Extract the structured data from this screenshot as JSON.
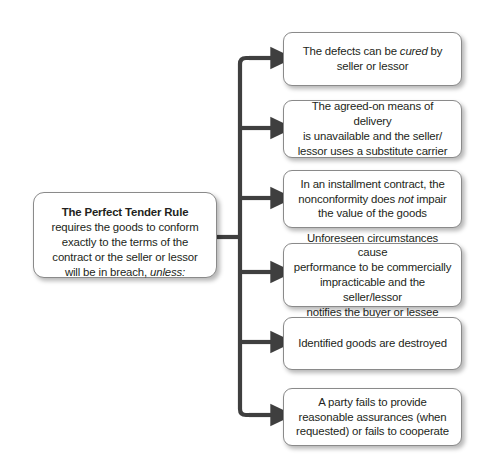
{
  "diagram": {
    "type": "flowchart-bracket",
    "root": {
      "heading": "The Perfect Tender Rule",
      "body_line1": "requires the goods to conform",
      "body_line2": "exactly to the terms of the",
      "body_line3": "contract or the seller or lessor",
      "body_line4_pre": "will be in breach, ",
      "body_line4_ital": "unless:",
      "full_text": "The Perfect Tender Rule requires the goods to conform exactly to the terms of the contract or the seller or lessor will be in breach, unless:"
    },
    "branches": [
      {
        "id": "defects-cured",
        "segments": [
          {
            "text": "The defects can be ",
            "style": "normal"
          },
          {
            "text": "cured",
            "style": "italic"
          },
          {
            "text": " by\nseller or lessor",
            "style": "normal"
          }
        ],
        "full_text": "The defects can be cured by seller or lessor"
      },
      {
        "id": "substitute-carrier",
        "segments": [
          {
            "text": "The agreed-on means of delivery\nis unavailable and the seller/\nlessor uses a substitute carrier",
            "style": "normal"
          }
        ],
        "full_text": "The agreed-on means of delivery is unavailable and the seller/lessor uses a substitute carrier"
      },
      {
        "id": "installment-nonconformity",
        "segments": [
          {
            "text": "In an installment contract, the\nnonconformity does ",
            "style": "normal"
          },
          {
            "text": "not",
            "style": "italic"
          },
          {
            "text": " impair\nthe value of the goods",
            "style": "normal"
          }
        ],
        "full_text": "In an installment contract, the nonconformity does not impair the value of the goods"
      },
      {
        "id": "commercial-impracticability",
        "segments": [
          {
            "text": "Unforeseen circumstances cause\nperformance to be commercially\nimpracticable and the seller/lessor\nnotifies the buyer or lessee",
            "style": "normal"
          }
        ],
        "full_text": "Unforeseen circumstances cause performance to be commercially impracticable and the seller/lessor notifies the buyer or lessee"
      },
      {
        "id": "goods-destroyed",
        "segments": [
          {
            "text": "Identified goods are destroyed",
            "style": "normal"
          }
        ],
        "full_text": "Identified goods are destroyed"
      },
      {
        "id": "failure-to-assure",
        "segments": [
          {
            "text": "A party fails to provide\nreasonable assurances (when\nrequested) or fails to cooperate",
            "style": "normal"
          }
        ],
        "full_text": "A party fails to provide reasonable assurances (when requested) or fails to cooperate"
      }
    ],
    "colors": {
      "background": "#ffffff",
      "box_fill": "#ffffff",
      "box_border": "#8a8a8a",
      "text": "#231f20",
      "connector": "#3f3f3f",
      "shadow": "rgba(0,0,0,0.28)"
    }
  }
}
